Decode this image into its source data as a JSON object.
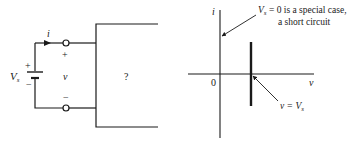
{
  "circuit": {
    "current_label": "i",
    "source_label": "V",
    "source_subscript": "s",
    "source_plus": "+",
    "source_minus": "−",
    "terminal_plus": "+",
    "terminal_minus": "−",
    "voltage_label": "v",
    "unknown_box_label": "?"
  },
  "graph": {
    "y_axis_label": "i",
    "x_axis_label": "v",
    "origin_label": "0",
    "annotation_short_circuit_line1_pre": "V",
    "annotation_short_circuit_line1_sub": "s",
    "annotation_short_circuit_line1_post": " = 0 is a special case,",
    "annotation_short_circuit_line2": "a short circuit",
    "annotation_vs_pre": "v = V",
    "annotation_vs_sub": "s"
  },
  "colors": {
    "ink": "#1a1a1a",
    "background": "#ffffff"
  }
}
